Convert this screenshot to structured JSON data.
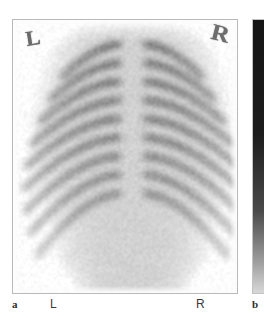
{
  "figure": {
    "modality": "bone-scintigraphy",
    "view": "posterior thorax and abdomen",
    "background_color": "#ffffff",
    "frame_color": "#b9b9b9"
  },
  "panels": [
    {
      "id": "a",
      "caption_label": "a",
      "name": "scintigram-panel",
      "frame": {
        "x": 12,
        "y": 19,
        "width": 226,
        "height": 275
      },
      "in_image_markers": [
        {
          "name": "orientation-marker-left",
          "text": "L",
          "position": "top-left"
        },
        {
          "name": "orientation-marker-right",
          "text": "R",
          "position": "top-right"
        }
      ]
    },
    {
      "id": "b",
      "caption_label": "b",
      "name": "grayscale-colorbar-panel",
      "frame": {
        "x": 252,
        "y": 19,
        "width": 12,
        "height": 275
      },
      "orientation": "vertical",
      "high_end": "top",
      "low_end": "bottom",
      "colors": {
        "top": "#151515",
        "upper_mid": "#1d1d1d",
        "mid": "#4a4a4a",
        "lower_mid": "#9b9b9b",
        "bottom": "#d8d8d8"
      }
    }
  ],
  "caption": {
    "panel_a_label": "a",
    "panel_b_label": "b",
    "orientation_left": "L",
    "orientation_right": "R"
  },
  "image_content": {
    "description": "Posterior whole-body bone scan segment showing spine, rib cage and kidneys",
    "intensity_scale": "dark = high radiotracer uptake, light = low uptake",
    "background_tone": "#fbfbfb",
    "structures": [
      {
        "name": "thoracic-spine",
        "uptake": "moderate"
      },
      {
        "name": "lumbar-spine",
        "uptake": "moderate"
      },
      {
        "name": "focal-hot-spot",
        "uptake": "intense",
        "location": "mid-thoracic spine"
      },
      {
        "name": "rib-cage-left",
        "uptake": "low-moderate"
      },
      {
        "name": "rib-cage-right",
        "uptake": "low-moderate"
      },
      {
        "name": "kidney-left",
        "uptake": "moderate"
      },
      {
        "name": "kidney-right",
        "uptake": "moderate"
      },
      {
        "name": "sacrum",
        "uptake": "moderate"
      }
    ]
  }
}
